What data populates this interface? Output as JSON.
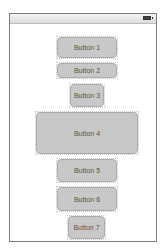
{
  "device": {
    "status_bar": {
      "battery_icon": "battery-icon"
    }
  },
  "buttons": [
    {
      "label": "Button 1"
    },
    {
      "label": "Button 2"
    },
    {
      "label": "Button 3"
    },
    {
      "label": "Button 4"
    },
    {
      "label": "Button 5"
    },
    {
      "label": "Button 6"
    },
    {
      "label": "Button 7"
    }
  ],
  "colors": {
    "button_fill": "#c8c8c8",
    "button_border": "#ababab",
    "frame_border": "#7d7d7d"
  }
}
